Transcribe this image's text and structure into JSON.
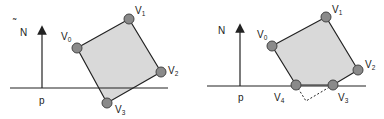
{
  "colors": {
    "polygon_fill": "#d9d9d9",
    "stroke": "#222222",
    "vertex_fill": "#8a8a8a",
    "background": "#ffffff"
  },
  "left_panel": {
    "normal_label": "N",
    "point_label": "p",
    "vertices": [
      {
        "name": "V",
        "sub": "0"
      },
      {
        "name": "V",
        "sub": "1"
      },
      {
        "name": "V",
        "sub": "2"
      },
      {
        "name": "V",
        "sub": "3"
      }
    ]
  },
  "right_panel": {
    "normal_label": "N",
    "point_label": "p",
    "vertices": [
      {
        "name": "V",
        "sub": "0"
      },
      {
        "name": "V",
        "sub": "1"
      },
      {
        "name": "V",
        "sub": "2"
      },
      {
        "name": "V",
        "sub": "3"
      },
      {
        "name": "V",
        "sub": "4"
      }
    ]
  }
}
